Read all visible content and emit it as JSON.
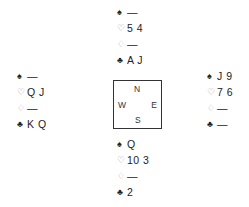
{
  "icons": {
    "spade": "♠",
    "heart": "♡",
    "diamond": "♢",
    "club": "♣"
  },
  "hands": {
    "north": {
      "spades": "—",
      "hearts": "5 4",
      "diamonds": "—",
      "clubs": "A J"
    },
    "west": {
      "spades": "—",
      "hearts": "Q J",
      "diamonds": "—",
      "clubs": "K Q"
    },
    "east": {
      "spades": "J 9",
      "hearts": "7 6",
      "diamonds": "—",
      "clubs": "—"
    },
    "south": {
      "spades": "Q",
      "hearts": "10 3",
      "diamonds": "—",
      "clubs": "2"
    }
  },
  "compass": {
    "n": "N",
    "s": "S",
    "w": "W",
    "e": "E"
  }
}
